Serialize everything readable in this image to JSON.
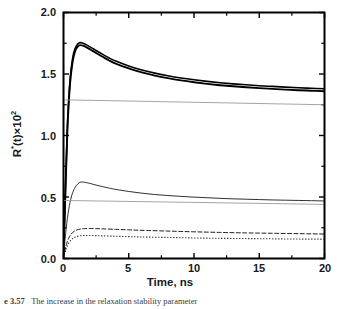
{
  "figure": {
    "caption_prefix": "e 3.57",
    "caption_text": "The increase in the relaxation stability parameter",
    "background_color": "#ffffff"
  },
  "axes": {
    "x_title": "Time, ns",
    "y_title_base": "R",
    "y_title_super": "*",
    "y_title_rest": "(t)×10",
    "y_title_exp": "2",
    "x_tick_labels": [
      "0",
      "5",
      "10",
      "15",
      "20"
    ],
    "y_tick_labels": [
      "0.0",
      "0.5",
      "1.0",
      "1.5",
      "2.0"
    ],
    "frame_color": "#000000"
  },
  "chart_data": {
    "type": "line",
    "title": "",
    "xlabel": "Time, ns",
    "ylabel": "R*(t)×10^2",
    "xlim": [
      0,
      20
    ],
    "ylim": [
      0.0,
      2.0
    ],
    "xticks": [
      0,
      5,
      10,
      15,
      20
    ],
    "yticks": [
      0.0,
      0.5,
      1.0,
      1.5,
      2.0
    ],
    "x_minor_ticks": [
      2.5,
      7.5,
      12.5,
      17.5
    ],
    "y_minor_ticks": [
      0.25,
      0.75,
      1.25,
      1.75
    ],
    "grid": false,
    "legend": false,
    "legend_position": "none",
    "series": [
      {
        "name": "upper-solid-thick-a",
        "style": "solid",
        "color": "#000000",
        "width": 1.9,
        "x": [
          0,
          0.15,
          0.3,
          0.5,
          0.7,
          0.9,
          1.1,
          1.3,
          1.5,
          1.8,
          2.2,
          2.6,
          3.0,
          3.5,
          4.0,
          5.0,
          6.0,
          7.0,
          8.0,
          9.0,
          10.0,
          11.0,
          12.0,
          13.0,
          14.0,
          15.0,
          16.0,
          17.0,
          18.0,
          19.0,
          20.0
        ],
        "y": [
          0.02,
          0.55,
          1.05,
          1.42,
          1.6,
          1.69,
          1.725,
          1.735,
          1.73,
          1.715,
          1.69,
          1.665,
          1.64,
          1.61,
          1.585,
          1.545,
          1.513,
          1.487,
          1.466,
          1.448,
          1.433,
          1.42,
          1.409,
          1.4,
          1.392,
          1.385,
          1.379,
          1.373,
          1.368,
          1.364,
          1.36
        ]
      },
      {
        "name": "upper-solid-thick-b",
        "style": "solid",
        "color": "#000000",
        "width": 1.6,
        "x": [
          0,
          0.15,
          0.3,
          0.5,
          0.7,
          0.9,
          1.1,
          1.3,
          1.5,
          1.8,
          2.2,
          2.6,
          3.0,
          3.5,
          4.0,
          5.0,
          6.0,
          7.0,
          8.0,
          9.0,
          10.0,
          11.0,
          12.0,
          13.0,
          14.0,
          15.0,
          16.0,
          17.0,
          18.0,
          19.0,
          20.0
        ],
        "y": [
          0.02,
          0.57,
          1.08,
          1.45,
          1.63,
          1.71,
          1.745,
          1.755,
          1.75,
          1.735,
          1.71,
          1.685,
          1.66,
          1.63,
          1.605,
          1.565,
          1.533,
          1.507,
          1.486,
          1.468,
          1.453,
          1.44,
          1.429,
          1.42,
          1.412,
          1.405,
          1.399,
          1.393,
          1.388,
          1.384,
          1.38
        ]
      },
      {
        "name": "upper-gray-baseline",
        "style": "solid",
        "color": "#9a9a9a",
        "width": 0.9,
        "x": [
          0,
          20
        ],
        "y": [
          1.29,
          1.25
        ]
      },
      {
        "name": "middle-solid-thin",
        "style": "solid",
        "color": "#1a1a1a",
        "width": 0.9,
        "x": [
          0,
          0.2,
          0.4,
          0.6,
          0.8,
          1.0,
          1.2,
          1.4,
          1.6,
          2.0,
          2.5,
          3.0,
          3.5,
          4.0,
          5.0,
          6.0,
          7.0,
          8.0,
          9.0,
          10.0,
          11.0,
          12.0,
          13.0,
          14.0,
          15.0,
          16.0,
          17.0,
          18.0,
          19.0,
          20.0
        ],
        "y": [
          0.01,
          0.24,
          0.4,
          0.5,
          0.56,
          0.595,
          0.615,
          0.622,
          0.62,
          0.611,
          0.597,
          0.584,
          0.572,
          0.562,
          0.545,
          0.531,
          0.52,
          0.512,
          0.505,
          0.499,
          0.494,
          0.489,
          0.485,
          0.482,
          0.479,
          0.476,
          0.474,
          0.472,
          0.47,
          0.468
        ]
      },
      {
        "name": "middle-gray-baseline",
        "style": "solid",
        "color": "#9a9a9a",
        "width": 0.9,
        "x": [
          0,
          20
        ],
        "y": [
          0.472,
          0.44
        ]
      },
      {
        "name": "lower-dashed",
        "style": "dashed",
        "color": "#1a1a1a",
        "width": 1.0,
        "x": [
          0,
          0.2,
          0.4,
          0.6,
          0.8,
          1.0,
          1.3,
          1.6,
          2.0,
          2.5,
          3.0,
          4.0,
          5.0,
          6.0,
          8.0,
          10.0,
          12.0,
          14.0,
          16.0,
          18.0,
          20.0
        ],
        "y": [
          0.005,
          0.105,
          0.165,
          0.2,
          0.22,
          0.231,
          0.24,
          0.243,
          0.244,
          0.243,
          0.241,
          0.237,
          0.233,
          0.229,
          0.223,
          0.217,
          0.212,
          0.208,
          0.205,
          0.202,
          0.199
        ]
      },
      {
        "name": "lower-dotted",
        "style": "dotted",
        "color": "#1a1a1a",
        "width": 1.1,
        "x": [
          0,
          0.2,
          0.4,
          0.6,
          0.8,
          1.0,
          1.3,
          1.6,
          2.0,
          2.5,
          3.0,
          4.0,
          5.0,
          6.0,
          8.0,
          10.0,
          12.0,
          14.0,
          16.0,
          18.0,
          20.0
        ],
        "y": [
          0.004,
          0.078,
          0.125,
          0.152,
          0.169,
          0.178,
          0.185,
          0.187,
          0.187,
          0.186,
          0.184,
          0.181,
          0.178,
          0.175,
          0.171,
          0.167,
          0.164,
          0.162,
          0.16,
          0.158,
          0.157
        ]
      }
    ]
  }
}
